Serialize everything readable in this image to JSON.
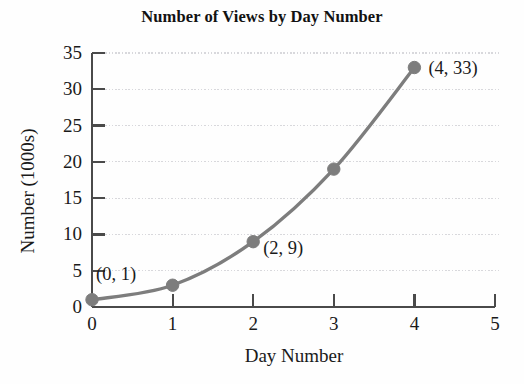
{
  "chart_data": {
    "type": "line",
    "title": "Number of Views by Day Number",
    "xlabel": "Day Number",
    "ylabel": "Number (1000s)",
    "xlim": [
      0,
      5
    ],
    "ylim": [
      0,
      35
    ],
    "grid": true,
    "legend": "none",
    "x_ticks": [
      "0",
      "1",
      "2",
      "3",
      "4",
      "5"
    ],
    "y_ticks": [
      "0",
      "5",
      "10",
      "15",
      "20",
      "25",
      "30",
      "35"
    ],
    "x_tick_values": [
      0,
      1,
      2,
      3,
      4,
      5
    ],
    "y_tick_values": [
      0,
      5,
      10,
      15,
      20,
      25,
      30,
      35
    ],
    "series": [
      {
        "name": "Views",
        "x": [
          0,
          1,
          2,
          3,
          4
        ],
        "values": [
          1,
          3,
          9,
          19,
          33
        ],
        "color": "#7d7d7d",
        "marker": "circle"
      }
    ],
    "annotations": [
      {
        "label": "(0, 1)",
        "x": 0,
        "y": 1
      },
      {
        "label": "(2, 9)",
        "x": 2,
        "y": 9
      },
      {
        "label": "(4, 33)",
        "x": 4,
        "y": 33
      }
    ],
    "colors": {
      "line": "#7d7d7d",
      "marker": "#7d7d7d",
      "axis": "#4a4a4a",
      "grid": "#d8d8dc",
      "text": "#1a1a1a",
      "background": "#fefefe"
    }
  }
}
